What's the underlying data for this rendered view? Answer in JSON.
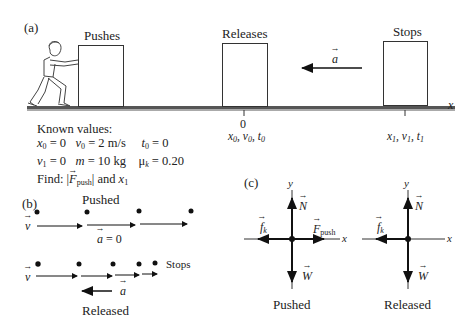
{
  "panel_a": {
    "label": "(a)",
    "stages": [
      {
        "label": "Pushes"
      },
      {
        "label": "Releases"
      },
      {
        "label": "Stops"
      }
    ],
    "accel_label": "a",
    "axis_label": "x",
    "origin_tick": "0",
    "origin_vars": "x0, v0, t0",
    "end_vars": "x1, v1, t1",
    "known": {
      "title": "Known values:",
      "row1": [
        "x0 = 0",
        "v0 = 2 m/s",
        "t0 = 0"
      ],
      "row2": [
        "v1 = 0",
        "m = 10 kg",
        "μk = 0.20"
      ],
      "find": "Find: |F_push| and x1"
    }
  },
  "panel_b": {
    "label": "(b)",
    "pushed": {
      "title": "Pushed",
      "v_label": "v",
      "accel_text": "a = 0",
      "dots": 4
    },
    "released": {
      "title": "Released",
      "v_label": "v",
      "accel_label": "a",
      "stop_label": "Stops",
      "dots": 5
    }
  },
  "panel_c": {
    "label": "(c)",
    "diagrams": [
      {
        "title": "Pushed",
        "forces": [
          "N",
          "W",
          "f_k",
          "F_push"
        ],
        "axes": [
          "x",
          "y"
        ]
      },
      {
        "title": "Released",
        "forces": [
          "N",
          "W",
          "f_k"
        ],
        "axes": [
          "x",
          "y"
        ]
      }
    ]
  }
}
